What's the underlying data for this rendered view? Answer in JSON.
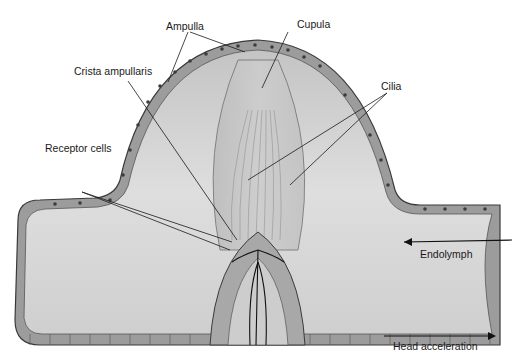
{
  "diagram": {
    "type": "anatomical-cross-section",
    "labels": {
      "ampulla": "Ampulla",
      "cupula": "Cupula",
      "crista": "Crista ampullaris",
      "cilia": "Cilia",
      "receptor_cells": "Receptor cells",
      "endolymph": "Endolymph",
      "head_acceleration": "Head acceleration"
    },
    "arrows": {
      "endolymph_direction": "left",
      "head_acceleration_direction": "right"
    },
    "colors": {
      "background": "#ffffff",
      "lumen": "#d4d4d4",
      "epithelium": "#9a9a9a",
      "outline": "#3a3a3a",
      "text": "#1a1a1a"
    }
  }
}
